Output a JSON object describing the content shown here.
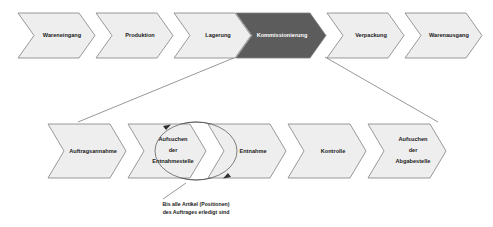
{
  "diagram": {
    "colors": {
      "chevron_light_fill": "#eeeeee",
      "chevron_dark_fill": "#5c5c5c",
      "chevron_stroke": "#808080",
      "label_color": "#1a1a1a",
      "label_inverse_color": "#ffffff",
      "connector_color": "#6b6b6b",
      "background": "#ffffff"
    },
    "top_row": {
      "name": "main-process-chain",
      "steps": [
        {
          "label": "Wareneingang",
          "highlighted": false
        },
        {
          "label": "Produktion",
          "highlighted": false
        },
        {
          "label": "Lagerung",
          "highlighted": false
        },
        {
          "label": "Kommissionierung",
          "highlighted": true
        },
        {
          "label": "Verpackung",
          "highlighted": false
        },
        {
          "label": "Warenausgang",
          "highlighted": false
        }
      ]
    },
    "bottom_row": {
      "name": "kommissionierung-detail-chain",
      "steps": [
        {
          "label": "Auftragsannahme",
          "lines": [
            "Auftragsannahme"
          ]
        },
        {
          "label": "Aufsuchen der Entnahmestelle",
          "lines": [
            "Aufsuchen",
            "der",
            "Entnahmestelle"
          ]
        },
        {
          "label": "Entnahme",
          "lines": [
            "Entnahme"
          ]
        },
        {
          "label": "Kontrolle",
          "lines": [
            "Kontrolle"
          ]
        },
        {
          "label": "Aufsuchen der Abgabestelle",
          "lines": [
            "Aufsuchen",
            "der",
            "Abgabestelle"
          ]
        }
      ]
    },
    "loop": {
      "name": "repeat-loop",
      "caption_lines": [
        "Bis alle Artikel (Positionen)",
        "des Auftrages erledigt sind"
      ]
    }
  }
}
